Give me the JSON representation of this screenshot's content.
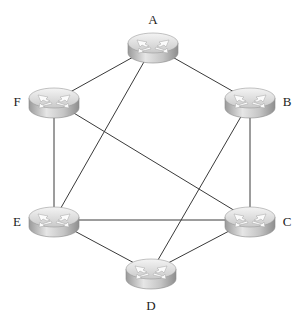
{
  "diagram": {
    "type": "network-topology",
    "caption_fragment": "",
    "colors": {
      "background": "#ffffff",
      "link": "#3a3a3a",
      "router_top": "#d9d9d9",
      "router_top_highlight": "#f2f2f2",
      "router_side": "#b8b8b8",
      "router_side_dark": "#8f8f8f",
      "router_arrows": "#fafafa",
      "label": "#222222"
    },
    "nodes": [
      {
        "id": "A",
        "label": "A",
        "icon": "router-icon",
        "x": 153,
        "y": 46,
        "label_x": 153,
        "label_y": 24
      },
      {
        "id": "B",
        "label": "B",
        "icon": "router-icon",
        "x": 250,
        "y": 101,
        "label_x": 287,
        "label_y": 106
      },
      {
        "id": "C",
        "label": "C",
        "icon": "router-icon",
        "x": 250,
        "y": 220,
        "label_x": 287,
        "label_y": 226
      },
      {
        "id": "D",
        "label": "D",
        "icon": "router-icon",
        "x": 151,
        "y": 272,
        "label_x": 151,
        "label_y": 310
      },
      {
        "id": "E",
        "label": "E",
        "icon": "router-icon",
        "x": 54,
        "y": 220,
        "label_x": 17,
        "label_y": 226
      },
      {
        "id": "F",
        "label": "F",
        "icon": "router-icon",
        "x": 54,
        "y": 101,
        "label_x": 17,
        "label_y": 106
      }
    ],
    "edges": [
      {
        "from": "A",
        "to": "F"
      },
      {
        "from": "A",
        "to": "B"
      },
      {
        "from": "A",
        "to": "E"
      },
      {
        "from": "F",
        "to": "E"
      },
      {
        "from": "F",
        "to": "C"
      },
      {
        "from": "B",
        "to": "C"
      },
      {
        "from": "B",
        "to": "D"
      },
      {
        "from": "E",
        "to": "C"
      },
      {
        "from": "E",
        "to": "D"
      },
      {
        "from": "D",
        "to": "C"
      }
    ]
  }
}
